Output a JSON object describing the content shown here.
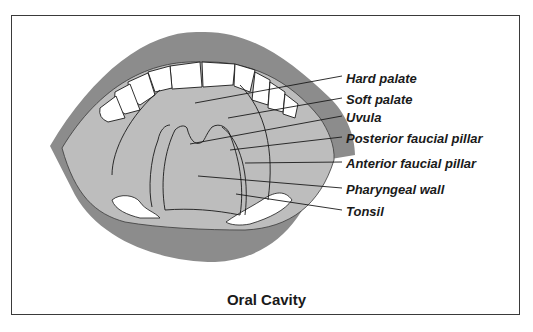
{
  "diagram": {
    "title": "Oral Cavity",
    "labels": [
      {
        "text": "Hard palate",
        "y": 72
      },
      {
        "text": "Soft palate",
        "y": 93
      },
      {
        "text": "Uvula",
        "y": 111
      },
      {
        "text": "Posterior faucial pillar",
        "y": 132
      },
      {
        "text": "Anterior faucial pillar",
        "y": 157
      },
      {
        "text": "Pharyngeal wall",
        "y": 183
      },
      {
        "text": "Tonsil",
        "y": 205
      }
    ],
    "colors": {
      "lip": "#8c8c8c",
      "cavity": "#bdbdbd",
      "outline": "#1a1a1a",
      "teeth": "#ffffff",
      "frame": "#3a3a3a"
    }
  }
}
